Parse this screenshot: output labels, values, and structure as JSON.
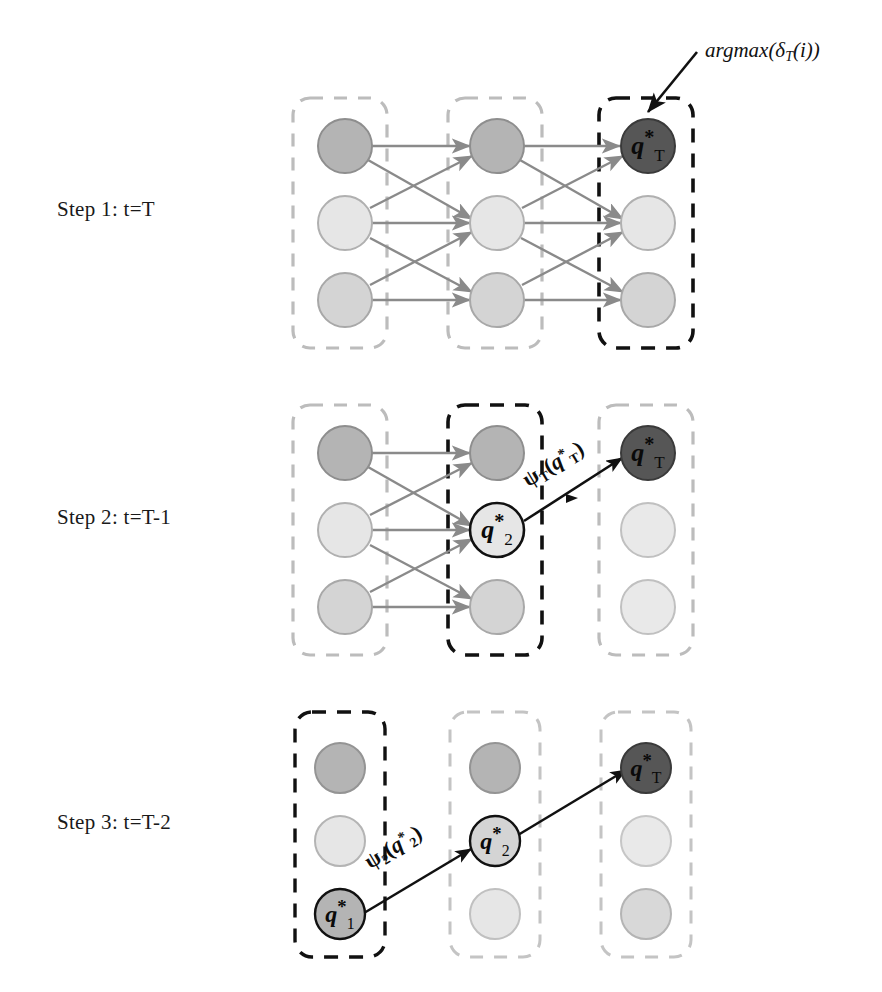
{
  "figure": {
    "title_annotation": {
      "text": "argmax(δT(i))",
      "prefix": "argmax(δ",
      "subscript": "T",
      "suffix": "(i))"
    }
  },
  "steps": [
    {
      "id": "step-1",
      "label": "Step 1: t=T"
    },
    {
      "id": "step-2",
      "label": "Step 2: t=T-1"
    },
    {
      "id": "step-3",
      "label": "Step 3: t=T-2"
    }
  ],
  "node_labels": {
    "qT": {
      "base": "q",
      "sup": "*",
      "sub": "T"
    },
    "q2": {
      "base": "q",
      "sup": "*",
      "sub": "2"
    },
    "q1": {
      "base": "q",
      "sup": "*",
      "sub": "1"
    }
  },
  "psi_labels": {
    "psi_T": {
      "psi": "ψ",
      "sub": "T",
      "open": "(",
      "q": "q",
      "sup": "*",
      "qsub": "T",
      "close": ")"
    },
    "psi_2": {
      "psi": "ψ",
      "sub": "2",
      "open": "(",
      "q": "q",
      "sup": "*",
      "qsub": "2",
      "close": ")"
    }
  },
  "colors": {
    "node_dark": "#565656",
    "node_medium": "#b4b4b4",
    "node_light": "#e6e6e6",
    "node_mid_light": "#d4d4d4",
    "node_stroke": "#8e8e8e",
    "node_stroke_active": "#111111",
    "box_inactive": "#bcbcbc",
    "box_active": "#111111",
    "edge": "#8a8a8a",
    "edge_active": "#111111",
    "text": "#111111",
    "background": "#ffffff"
  },
  "panels": [
    {
      "name": "panel-step-1",
      "columns": [
        {
          "name": "column-1",
          "active": false,
          "nodes": [
            {
              "name": "node-c1-r1",
              "fill": "#b4b4b4",
              "label": null
            },
            {
              "name": "node-c1-r2",
              "fill": "#e6e6e6",
              "label": null
            },
            {
              "name": "node-c1-r3",
              "fill": "#d4d4d4",
              "label": null
            }
          ]
        },
        {
          "name": "column-2",
          "active": false,
          "nodes": [
            {
              "name": "node-c2-r1",
              "fill": "#b4b4b4",
              "label": null
            },
            {
              "name": "node-c2-r2",
              "fill": "#e6e6e6",
              "label": null
            },
            {
              "name": "node-c2-r3",
              "fill": "#d4d4d4",
              "label": null
            }
          ]
        },
        {
          "name": "column-3",
          "active": true,
          "nodes": [
            {
              "name": "node-c3-r1",
              "fill": "#565656",
              "label": "qT"
            },
            {
              "name": "node-c3-r2",
              "fill": "#e6e6e6",
              "label": null
            },
            {
              "name": "node-c3-r3",
              "fill": "#d4d4d4",
              "label": null
            }
          ]
        }
      ],
      "edges_full_trellis": true,
      "highlight_path": []
    },
    {
      "name": "panel-step-2",
      "columns": [
        {
          "name": "column-1",
          "active": false,
          "nodes": [
            {
              "name": "node-c1-r1",
              "fill": "#b4b4b4",
              "label": null
            },
            {
              "name": "node-c1-r2",
              "fill": "#e6e6e6",
              "label": null
            },
            {
              "name": "node-c1-r3",
              "fill": "#d4d4d4",
              "label": null
            }
          ]
        },
        {
          "name": "column-2",
          "active": true,
          "nodes": [
            {
              "name": "node-c2-r1",
              "fill": "#b4b4b4",
              "label": null
            },
            {
              "name": "node-c2-r2",
              "fill": "#e6e6e6",
              "label": "q2"
            },
            {
              "name": "node-c2-r3",
              "fill": "#d4d4d4",
              "label": null
            }
          ]
        },
        {
          "name": "column-3",
          "active": false,
          "nodes": [
            {
              "name": "node-c3-r1",
              "fill": "#565656",
              "label": "qT"
            },
            {
              "name": "node-c3-r2",
              "fill": "#e6e6e6",
              "label": null
            },
            {
              "name": "node-c3-r3",
              "fill": "#e6e6e6",
              "label": null
            }
          ]
        }
      ],
      "edges_first_stage_only": true,
      "highlight_path": [
        {
          "from": "c2-r2",
          "to": "c3-r1",
          "label": "psi_T"
        }
      ]
    },
    {
      "name": "panel-step-3",
      "columns": [
        {
          "name": "column-1",
          "active": true,
          "nodes": [
            {
              "name": "node-c1-r1",
              "fill": "#b4b4b4",
              "label": null
            },
            {
              "name": "node-c1-r2",
              "fill": "#e6e6e6",
              "label": null
            },
            {
              "name": "node-c1-r3",
              "fill": "#b4b4b4",
              "label": "q1"
            }
          ]
        },
        {
          "name": "column-2",
          "active": false,
          "nodes": [
            {
              "name": "node-c2-r1",
              "fill": "#b4b4b4",
              "label": null
            },
            {
              "name": "node-c2-r2",
              "fill": "#d4d4d4",
              "label": "q2"
            },
            {
              "name": "node-c2-r3",
              "fill": "#e6e6e6",
              "label": null
            }
          ]
        },
        {
          "name": "column-3",
          "active": false,
          "nodes": [
            {
              "name": "node-c3-r1",
              "fill": "#565656",
              "label": "qT"
            },
            {
              "name": "node-c3-r2",
              "fill": "#e6e6e6",
              "label": null
            },
            {
              "name": "node-c3-r3",
              "fill": "#d4d4d4",
              "label": null
            }
          ]
        }
      ],
      "edges_none": true,
      "highlight_path": [
        {
          "from": "c1-r3",
          "to": "c2-r2",
          "label": "psi_2"
        },
        {
          "from": "c2-r2",
          "to": "c3-r1",
          "label": null
        }
      ]
    }
  ]
}
